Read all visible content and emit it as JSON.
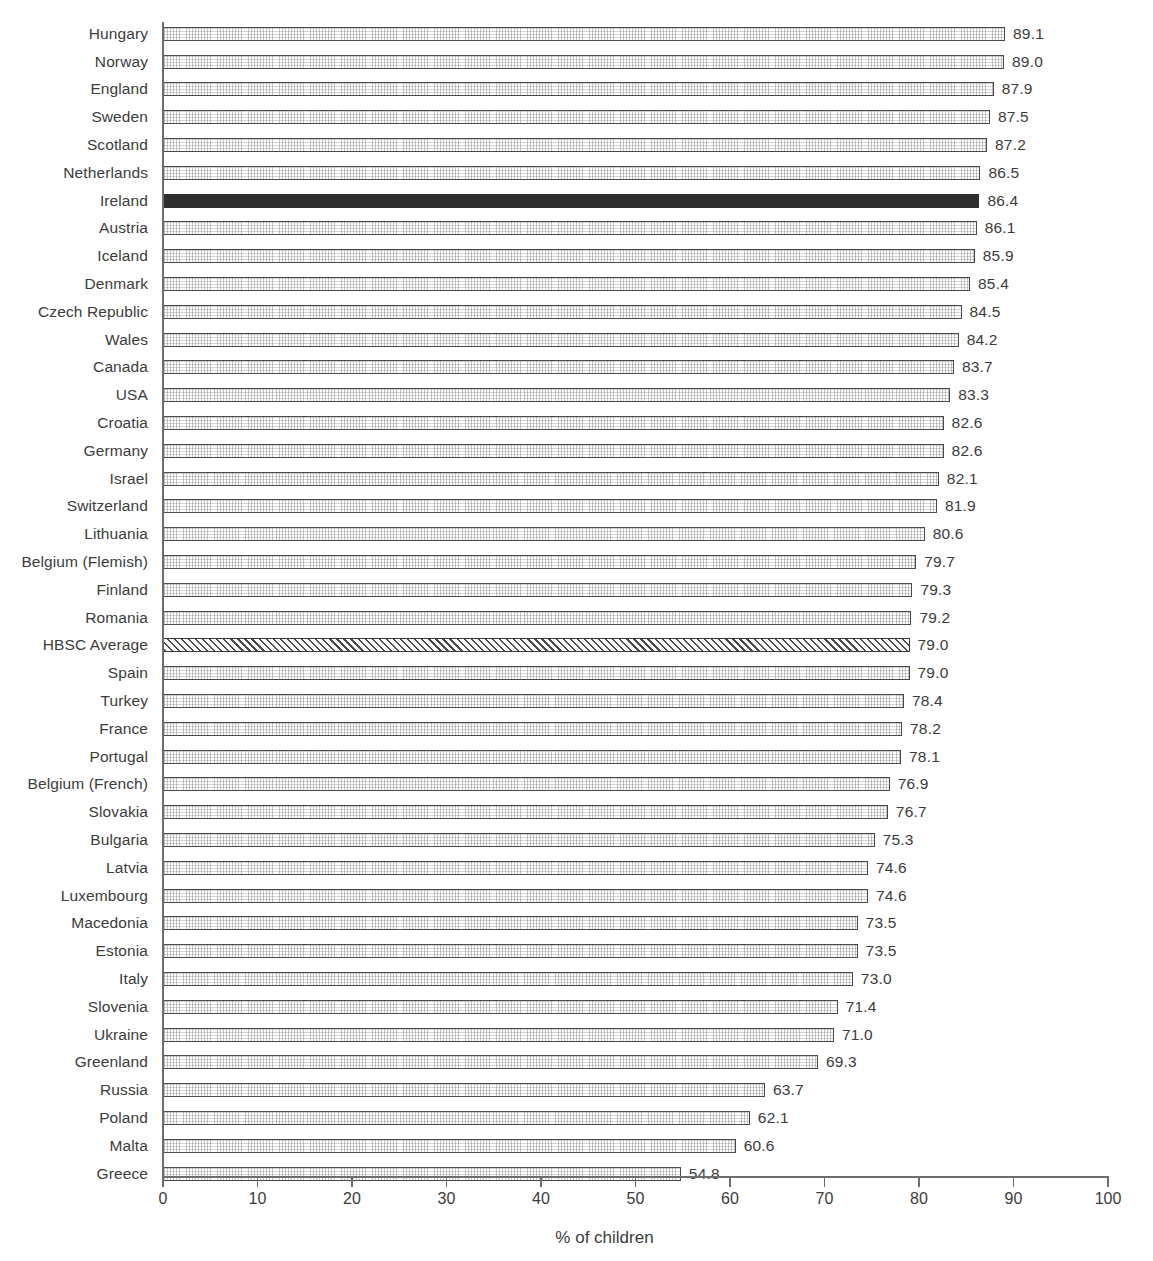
{
  "chart_data": {
    "type": "bar",
    "orientation": "horizontal",
    "title": "",
    "xlabel": "% of children",
    "ylabel": "",
    "xlim": [
      0,
      100
    ],
    "xticks": [
      0,
      10,
      20,
      30,
      40,
      50,
      60,
      70,
      80,
      90,
      100
    ],
    "grid": false,
    "legend": "none",
    "value_label_format": "one-decimal",
    "categories": [
      "Hungary",
      "Norway",
      "England",
      "Sweden",
      "Scotland",
      "Netherlands",
      "Ireland",
      "Austria",
      "Iceland",
      "Denmark",
      "Czech Republic",
      "Wales",
      "Canada",
      "USA",
      "Croatia",
      "Germany",
      "Israel",
      "Switzerland",
      "Lithuania",
      "Belgium (Flemish)",
      "Finland",
      "Romania",
      "HBSC Average",
      "Spain",
      "Turkey",
      "France",
      "Portugal",
      "Belgium (French)",
      "Slovakia",
      "Bulgaria",
      "Latvia",
      "Luxembourg",
      "Macedonia",
      "Estonia",
      "Italy",
      "Slovenia",
      "Ukraine",
      "Greenland",
      "Russia",
      "Poland",
      "Malta",
      "Greece"
    ],
    "values": [
      89.1,
      89.0,
      87.9,
      87.5,
      87.2,
      86.5,
      86.4,
      86.1,
      85.9,
      85.4,
      84.5,
      84.2,
      83.7,
      83.3,
      82.6,
      82.6,
      82.1,
      81.9,
      80.6,
      79.7,
      79.3,
      79.2,
      79.0,
      79.0,
      78.4,
      78.2,
      78.1,
      76.9,
      76.7,
      75.3,
      74.6,
      74.6,
      73.5,
      73.5,
      73.0,
      71.4,
      71.0,
      69.3,
      63.7,
      62.1,
      60.6,
      54.8
    ],
    "value_labels": [
      "89.1",
      "89.0",
      "87.9",
      "87.5",
      "87.2",
      "86.5",
      "86.4",
      "86.1",
      "85.9",
      "85.4",
      "84.5",
      "84.2",
      "83.7",
      "83.3",
      "82.6",
      "82.6",
      "82.1",
      "81.9",
      "80.6",
      "79.7",
      "79.3",
      "79.2",
      "79.0",
      "79.0",
      "78.4",
      "78.2",
      "78.1",
      "76.9",
      "76.7",
      "75.3",
      "74.6",
      "74.6",
      "73.5",
      "73.5",
      "73.0",
      "71.4",
      "71.0",
      "69.3",
      "63.7",
      "62.1",
      "60.6",
      "54.8"
    ],
    "styles": [
      "plain",
      "plain",
      "plain",
      "plain",
      "plain",
      "plain",
      "highlight",
      "plain",
      "plain",
      "plain",
      "plain",
      "plain",
      "plain",
      "plain",
      "plain",
      "plain",
      "plain",
      "plain",
      "plain",
      "plain",
      "plain",
      "plain",
      "average",
      "plain",
      "plain",
      "plain",
      "plain",
      "plain",
      "plain",
      "plain",
      "plain",
      "plain",
      "plain",
      "plain",
      "plain",
      "plain",
      "plain",
      "plain",
      "plain",
      "plain",
      "plain",
      "plain"
    ],
    "colors": {
      "bar_fill": "#fdfdfd",
      "bar_edge": "#4a4a4a",
      "highlight_fill": "#2e2e2e",
      "average_hatch": "#4a4a4a",
      "axis": "#6e6e6e",
      "text": "#3c3c3c",
      "background": "#ffffff"
    }
  }
}
